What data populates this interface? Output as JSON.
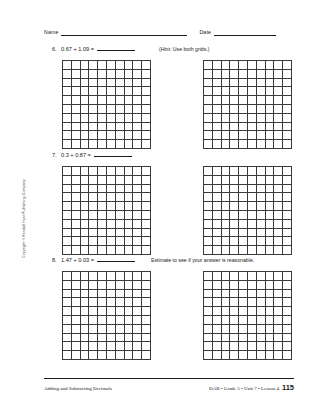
{
  "header": {
    "name_label": "Name",
    "date_label": "Date"
  },
  "problems": [
    {
      "number": "6.",
      "expression": "0.67 + 1.09 =",
      "note": "(Hint: Use both grids.)",
      "grids": 2,
      "grid_rows": 10,
      "grid_cols": 10
    },
    {
      "number": "7.",
      "expression": "0.3 + 0.87 =",
      "note": "",
      "grids": 2,
      "grid_rows": 10,
      "grid_cols": 10
    },
    {
      "number": "8.",
      "expression": "1.47 + 0.03 =",
      "note": "Estimate to see if your answer is reasonable.",
      "grids": 2,
      "grid_rows": 10,
      "grid_cols": 10
    }
  ],
  "copyright": "Copyright © Kendall Hunt Publishing Company",
  "footer": {
    "left": "Adding and Subtracting Decimals",
    "right": "DAB • Grade 5 • Unit 7 • Lesson 4",
    "page_number": "115"
  }
}
